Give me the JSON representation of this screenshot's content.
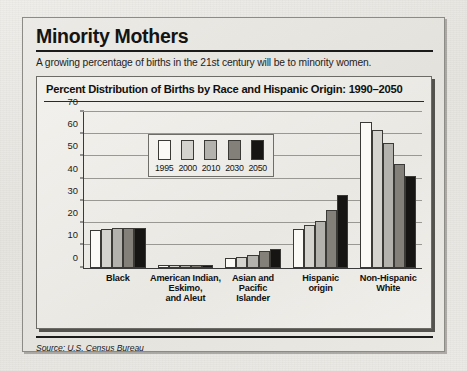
{
  "headline": "Minority Mothers",
  "deck": "A growing percentage of births in the 21st century will be to minority women.",
  "source": "Source: U.S. Census Bureau",
  "chart_data": {
    "type": "bar",
    "title": "Percent Distribution of Births by Race and Hispanic Origin: 1990–2050",
    "xlabel": "",
    "ylabel": "",
    "ylim": [
      0,
      70
    ],
    "yticks": [
      0,
      10,
      20,
      30,
      40,
      50,
      60,
      70
    ],
    "grid": true,
    "legend_position": "inside-upper-left",
    "categories": [
      "Black",
      "American Indian,\nEskimo,\nand Aleut",
      "Asian and\nPacific\nIslander",
      "Hispanic\norigin",
      "Non-Hispanic\nWhite"
    ],
    "series": [
      {
        "name": "1995",
        "color": "#fbfaf7",
        "values": [
          16.8,
          1.0,
          4.3,
          17.2,
          65.2
        ]
      },
      {
        "name": "2000",
        "color": "#d5d3ce",
        "values": [
          17.2,
          1.0,
          5.0,
          19.0,
          62.0
        ]
      },
      {
        "name": "2010",
        "color": "#b4b2ac",
        "values": [
          17.6,
          1.1,
          5.6,
          20.8,
          56.0
        ]
      },
      {
        "name": "2030",
        "color": "#838079",
        "values": [
          17.6,
          1.1,
          7.3,
          26.0,
          46.5
        ]
      },
      {
        "name": "2050",
        "color": "#161514",
        "values": [
          17.6,
          1.2,
          8.6,
          32.8,
          41.0
        ]
      }
    ]
  }
}
